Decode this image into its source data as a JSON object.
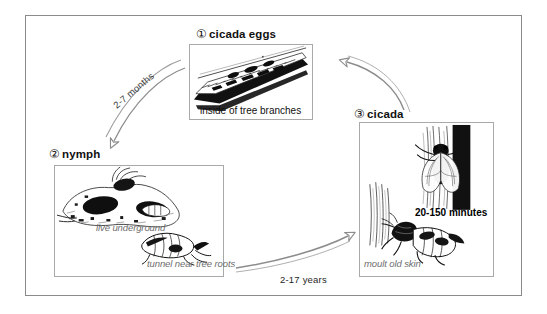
{
  "diagram": {
    "frame_color": "#8a8a8a",
    "panel_border_color": "#a9a9a9",
    "caption_gray": "#6e6e6e",
    "arrow_color": "#8c8c8c"
  },
  "stages": [
    {
      "number": "①",
      "label": "cicada eggs",
      "caption": "inside of tree branches",
      "caption_style": "black",
      "art": "eggs-in-branch"
    },
    {
      "number": "②",
      "label": "nymph",
      "caption_1": "live underground",
      "caption_2": "tunnel near tree roots",
      "caption_style": "gray-italic",
      "art": "nymphs-underground"
    },
    {
      "number": "③",
      "label": "cicada",
      "caption_time": "20-150 minutes",
      "caption_moult": "moult old skin",
      "caption_style": "gray-italic",
      "art": "adult-cicada-moulting"
    }
  ],
  "arrows": [
    {
      "name": "eggs-to-nymph",
      "label": "2-7 months",
      "direction": "down-left"
    },
    {
      "name": "nymph-to-cicada",
      "label": "2-17 years",
      "direction": "right"
    },
    {
      "name": "cicada-to-eggs",
      "label": "",
      "direction": "up-left"
    },
    {
      "name": "moult-to-adult",
      "label": "20-150 minutes",
      "direction": "up"
    }
  ]
}
